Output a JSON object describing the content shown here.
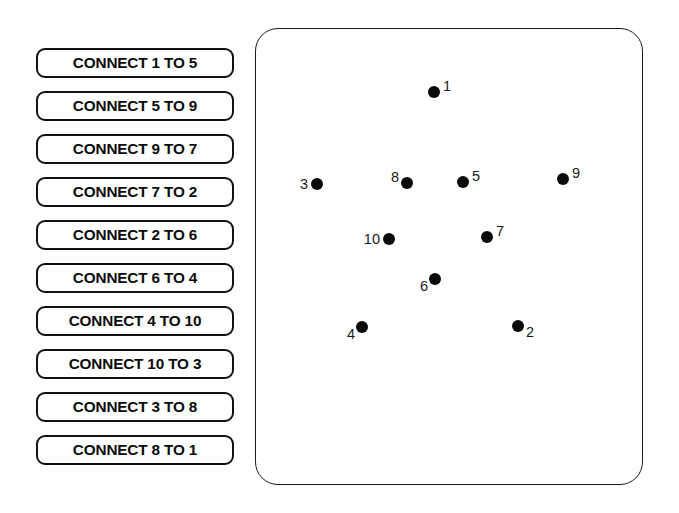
{
  "instructions": {
    "items": [
      {
        "label": "CONNECT 1 TO 5"
      },
      {
        "label": "CONNECT 5 TO 9"
      },
      {
        "label": "CONNECT 9 TO 7"
      },
      {
        "label": "CONNECT 7 TO 2"
      },
      {
        "label": "CONNECT 2 TO 6"
      },
      {
        "label": "CONNECT 6 TO 4"
      },
      {
        "label": "CONNECT 4 TO 10"
      },
      {
        "label": "CONNECT 10 TO 3"
      },
      {
        "label": "CONNECT 3 TO 8"
      },
      {
        "label": "CONNECT 8 TO 1"
      }
    ]
  },
  "canvas": {
    "dots": [
      {
        "label": "1",
        "x": 178,
        "y": 63
      },
      {
        "label": "3",
        "x": 61,
        "y": 155
      },
      {
        "label": "8",
        "x": 151,
        "y": 154
      },
      {
        "label": "5",
        "x": 207,
        "y": 153
      },
      {
        "label": "9",
        "x": 307,
        "y": 150
      },
      {
        "label": "10",
        "x": 133,
        "y": 210
      },
      {
        "label": "7",
        "x": 231,
        "y": 208
      },
      {
        "label": "6",
        "x": 179,
        "y": 250
      },
      {
        "label": "4",
        "x": 106,
        "y": 298
      },
      {
        "label": "2",
        "x": 262,
        "y": 297
      }
    ]
  },
  "colors": {
    "dot": "#0a0a0a",
    "border": "#111111",
    "background": "#ffffff",
    "text": "#0b0b0b"
  }
}
